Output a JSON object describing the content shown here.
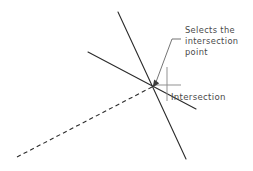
{
  "diagram": {
    "background_color": "#ffffff",
    "line_color": "#2b2b2b",
    "leader_color": "#5b5b5b",
    "marker_color": "#8c8c8c",
    "text_color": "#4a4a4a",
    "annotation": {
      "line1": "Selects the",
      "line2": "intersection",
      "line3": "point"
    },
    "snap_label": "Intersection",
    "intersection_point": {
      "x": 152,
      "y": 87
    },
    "lines": [
      {
        "name": "line-steep-upper-left-to-lower-right",
        "style": "solid",
        "x1": 118,
        "y1": 12,
        "x2": 186,
        "y2": 159
      },
      {
        "name": "line-shallow-upper-left-to-lower-right",
        "style": "solid",
        "x1": 88,
        "y1": 52,
        "x2": 196,
        "y2": 109
      },
      {
        "name": "line-dashed-lower-left-to-intersection",
        "style": "dashed",
        "x1": 17,
        "y1": 157,
        "x2": 152,
        "y2": 87
      }
    ],
    "leader": {
      "name": "annotation-leader",
      "horizontal_x1": 172,
      "horizontal_x2": 181,
      "horizontal_y": 39,
      "arrow_x": 155,
      "arrow_y": 83
    },
    "marker": {
      "name": "intersection-snap-marker",
      "vertical_x": 167,
      "vertical_y1": 67,
      "vertical_y2": 101,
      "horizontal_y": 85,
      "horizontal_x1": 154,
      "horizontal_x2": 181
    }
  }
}
